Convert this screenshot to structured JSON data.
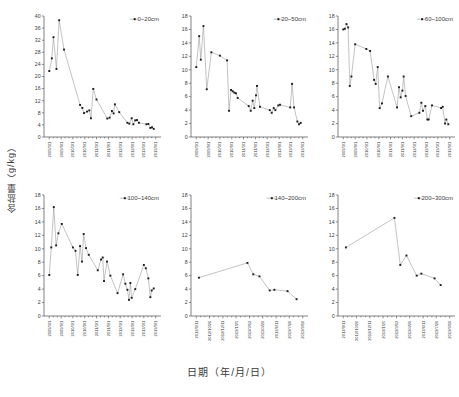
{
  "figure": {
    "ylabel": "含盐量（g/kg）",
    "xlabel": "日期（年/月/日）",
    "marker_color": "#1a1a1a",
    "line_color": "#9a9a9a"
  },
  "chart_data": [
    {
      "type": "scatter",
      "title": "",
      "legend": "0~20cm",
      "xlabel": "",
      "ylabel": "含盐量（g/kg）",
      "ylim": [
        0,
        40
      ],
      "yticks": [
        0,
        4,
        8,
        12,
        16,
        20,
        24,
        28,
        32,
        36,
        40
      ],
      "xticklabels": [
        "2009/3/1",
        "2009/9/1",
        "2010/3/1",
        "2010/9/1",
        "2011/3/1",
        "2011/9/1",
        "2012/3/1",
        "2012/9/1",
        "2013/3/1",
        "2013/9/1"
      ],
      "xlim_dates": [
        "2009/3/1",
        "2013/9/1"
      ],
      "grid": false,
      "legend_position": "top-right",
      "points": [
        {
          "x": "2009/03/01",
          "y": 21.8
        },
        {
          "x": "2009/04/10",
          "y": 26.0
        },
        {
          "x": "2009/05/05",
          "y": 33.0
        },
        {
          "x": "2009/06/20",
          "y": 22.5
        },
        {
          "x": "2009/08/01",
          "y": 38.6
        },
        {
          "x": "2009/10/15",
          "y": 28.9
        },
        {
          "x": "2010/06/20",
          "y": 10.6
        },
        {
          "x": "2010/07/25",
          "y": 9.6
        },
        {
          "x": "2010/08/20",
          "y": 7.9
        },
        {
          "x": "2010/10/05",
          "y": 8.4
        },
        {
          "x": "2010/11/10",
          "y": 8.8
        },
        {
          "x": "2010/12/05",
          "y": 6.2
        },
        {
          "x": "2011/01/10",
          "y": 15.9
        },
        {
          "x": "2011/03/01",
          "y": 12.4
        },
        {
          "x": "2011/08/15",
          "y": 6.1
        },
        {
          "x": "2011/09/20",
          "y": 6.4
        },
        {
          "x": "2011/10/25",
          "y": 8.6
        },
        {
          "x": "2011/11/20",
          "y": 7.8
        },
        {
          "x": "2011/12/10",
          "y": 10.8
        },
        {
          "x": "2012/02/15",
          "y": 8.2
        },
        {
          "x": "2012/06/20",
          "y": 4.7
        },
        {
          "x": "2012/07/20",
          "y": 4.4
        },
        {
          "x": "2012/08/25",
          "y": 6.2
        },
        {
          "x": "2012/09/20",
          "y": 4.2
        },
        {
          "x": "2012/10/20",
          "y": 5.5
        },
        {
          "x": "2012/11/15",
          "y": 5.6
        },
        {
          "x": "2012/12/15",
          "y": 4.7
        },
        {
          "x": "2013/04/10",
          "y": 4.2
        },
        {
          "x": "2013/05/10",
          "y": 4.3
        },
        {
          "x": "2013/06/10",
          "y": 3.0
        },
        {
          "x": "2013/07/05",
          "y": 3.2
        },
        {
          "x": "2013/08/01",
          "y": 2.7
        }
      ]
    },
    {
      "type": "scatter",
      "title": "",
      "legend": "20~50cm",
      "xlabel": "",
      "ylabel": "",
      "ylim": [
        0,
        18
      ],
      "yticks": [
        0,
        2,
        4,
        6,
        8,
        10,
        12,
        14,
        16,
        18
      ],
      "xticklabels": [
        "2009/3/1",
        "2009/9/1",
        "2010/3/1",
        "2010/9/1",
        "2011/3/1",
        "2011/9/1",
        "2012/3/1",
        "2012/9/1",
        "2013/3/1",
        "2013/9/1"
      ],
      "xlim_dates": [
        "2009/3/1",
        "2013/9/1"
      ],
      "grid": false,
      "legend_position": "top-right",
      "points": [
        {
          "x": "2009/03/01",
          "y": 10.4
        },
        {
          "x": "2009/04/15",
          "y": 15.0
        },
        {
          "x": "2009/05/10",
          "y": 11.5
        },
        {
          "x": "2009/06/20",
          "y": 16.5
        },
        {
          "x": "2009/08/10",
          "y": 7.1
        },
        {
          "x": "2009/10/20",
          "y": 12.6
        },
        {
          "x": "2010/03/01",
          "y": 12.1
        },
        {
          "x": "2010/06/20",
          "y": 11.4
        },
        {
          "x": "2010/07/20",
          "y": 3.9
        },
        {
          "x": "2010/08/20",
          "y": 7.0
        },
        {
          "x": "2010/09/15",
          "y": 6.8
        },
        {
          "x": "2010/10/10",
          "y": 6.6
        },
        {
          "x": "2010/11/05",
          "y": 6.5
        },
        {
          "x": "2010/12/01",
          "y": 5.8
        },
        {
          "x": "2011/05/20",
          "y": 4.6
        },
        {
          "x": "2011/06/20",
          "y": 3.9
        },
        {
          "x": "2011/07/20",
          "y": 5.4
        },
        {
          "x": "2011/08/15",
          "y": 4.3
        },
        {
          "x": "2011/09/10",
          "y": 6.2
        },
        {
          "x": "2011/09/25",
          "y": 7.6
        },
        {
          "x": "2011/11/10",
          "y": 4.5
        },
        {
          "x": "2012/04/10",
          "y": 4.0
        },
        {
          "x": "2012/05/10",
          "y": 3.6
        },
        {
          "x": "2012/06/10",
          "y": 4.3
        },
        {
          "x": "2012/07/05",
          "y": 4.0
        },
        {
          "x": "2012/08/20",
          "y": 4.7
        },
        {
          "x": "2012/09/15",
          "y": 4.8
        },
        {
          "x": "2013/02/20",
          "y": 4.4
        },
        {
          "x": "2013/03/20",
          "y": 7.9
        },
        {
          "x": "2013/04/20",
          "y": 4.4
        },
        {
          "x": "2013/06/10",
          "y": 2.3
        },
        {
          "x": "2013/07/05",
          "y": 1.9
        },
        {
          "x": "2013/08/01",
          "y": 2.1
        }
      ]
    },
    {
      "type": "scatter",
      "title": "",
      "legend": "60~100cm",
      "xlabel": "",
      "ylabel": "",
      "ylim": [
        0,
        18
      ],
      "yticks": [
        0,
        2,
        4,
        6,
        8,
        10,
        12,
        14,
        16,
        18
      ],
      "xticklabels": [
        "2009/3/1",
        "2009/9/1",
        "2010/3/1",
        "2010/9/1",
        "2011/3/1",
        "2011/9/1",
        "2012/3/1",
        "2012/9/1",
        "2013/3/1",
        "2013/9/1"
      ],
      "xlim_dates": [
        "2009/3/1",
        "2013/9/1"
      ],
      "grid": false,
      "legend_position": "top-right",
      "points": [
        {
          "x": "2009/03/01",
          "y": 16.0
        },
        {
          "x": "2009/03/25",
          "y": 16.1
        },
        {
          "x": "2009/04/20",
          "y": 16.8
        },
        {
          "x": "2009/05/15",
          "y": 16.3
        },
        {
          "x": "2009/06/10",
          "y": 7.6
        },
        {
          "x": "2009/07/05",
          "y": 9.0
        },
        {
          "x": "2009/09/01",
          "y": 13.8
        },
        {
          "x": "2010/02/20",
          "y": 13.1
        },
        {
          "x": "2010/04/20",
          "y": 12.8
        },
        {
          "x": "2010/06/20",
          "y": 8.5
        },
        {
          "x": "2010/07/15",
          "y": 7.9
        },
        {
          "x": "2010/08/15",
          "y": 10.4
        },
        {
          "x": "2010/09/15",
          "y": 4.3
        },
        {
          "x": "2010/10/20",
          "y": 5.0
        },
        {
          "x": "2011/01/20",
          "y": 9.0
        },
        {
          "x": "2011/06/10",
          "y": 4.4
        },
        {
          "x": "2011/07/10",
          "y": 7.4
        },
        {
          "x": "2011/08/05",
          "y": 5.9
        },
        {
          "x": "2011/09/01",
          "y": 6.9
        },
        {
          "x": "2011/09/20",
          "y": 9.0
        },
        {
          "x": "2011/10/20",
          "y": 6.1
        },
        {
          "x": "2012/01/15",
          "y": 3.1
        },
        {
          "x": "2012/05/20",
          "y": 3.6
        },
        {
          "x": "2012/06/20",
          "y": 5.1
        },
        {
          "x": "2012/07/15",
          "y": 3.9
        },
        {
          "x": "2012/08/20",
          "y": 4.6
        },
        {
          "x": "2012/09/20",
          "y": 2.6
        },
        {
          "x": "2012/10/10",
          "y": 2.6
        },
        {
          "x": "2012/12/01",
          "y": 4.7
        },
        {
          "x": "2013/04/20",
          "y": 4.3
        },
        {
          "x": "2013/05/15",
          "y": 4.5
        },
        {
          "x": "2013/06/20",
          "y": 2.0
        },
        {
          "x": "2013/07/10",
          "y": 2.6
        },
        {
          "x": "2013/08/10",
          "y": 1.9
        }
      ]
    },
    {
      "type": "scatter",
      "title": "",
      "legend": "100~140cm",
      "xlabel": "",
      "ylabel": "",
      "ylim": [
        0,
        18
      ],
      "yticks": [
        0,
        2,
        4,
        6,
        8,
        10,
        12,
        14,
        16,
        18
      ],
      "xticklabels": [
        "2009/3/1",
        "2009/9/1",
        "2010/3/1",
        "2010/9/1",
        "2011/3/1",
        "2011/9/1",
        "2012/3/1",
        "2012/9/1",
        "2013/3/1",
        "2013/9/1"
      ],
      "xlim_dates": [
        "2009/3/1",
        "2013/9/1"
      ],
      "grid": false,
      "legend_position": "top-right",
      "points": [
        {
          "x": "2009/03/01",
          "y": 6.1
        },
        {
          "x": "2009/04/01",
          "y": 10.2
        },
        {
          "x": "2009/05/10",
          "y": 16.2
        },
        {
          "x": "2009/06/15",
          "y": 10.5
        },
        {
          "x": "2009/07/20",
          "y": 12.3
        },
        {
          "x": "2009/09/10",
          "y": 13.7
        },
        {
          "x": "2010/03/01",
          "y": 10.2
        },
        {
          "x": "2010/04/10",
          "y": 9.7
        },
        {
          "x": "2010/05/15",
          "y": 6.1
        },
        {
          "x": "2010/06/20",
          "y": 10.4
        },
        {
          "x": "2010/07/20",
          "y": 8.1
        },
        {
          "x": "2010/08/15",
          "y": 12.2
        },
        {
          "x": "2010/09/20",
          "y": 10.1
        },
        {
          "x": "2010/11/01",
          "y": 9.1
        },
        {
          "x": "2011/03/20",
          "y": 6.8
        },
        {
          "x": "2011/05/10",
          "y": 8.4
        },
        {
          "x": "2011/06/05",
          "y": 8.7
        },
        {
          "x": "2011/06/25",
          "y": 5.2
        },
        {
          "x": "2011/08/10",
          "y": 8.1
        },
        {
          "x": "2011/10/01",
          "y": 6.0
        },
        {
          "x": "2012/01/20",
          "y": 3.4
        },
        {
          "x": "2012/04/15",
          "y": 6.2
        },
        {
          "x": "2012/05/20",
          "y": 4.8
        },
        {
          "x": "2012/06/20",
          "y": 3.9
        },
        {
          "x": "2012/07/15",
          "y": 2.4
        },
        {
          "x": "2012/08/05",
          "y": 4.9
        },
        {
          "x": "2012/08/25",
          "y": 2.7
        },
        {
          "x": "2012/10/20",
          "y": 4.0
        },
        {
          "x": "2013/03/01",
          "y": 7.6
        },
        {
          "x": "2013/04/01",
          "y": 7.1
        },
        {
          "x": "2013/05/10",
          "y": 5.6
        },
        {
          "x": "2013/06/10",
          "y": 2.8
        },
        {
          "x": "2013/07/01",
          "y": 3.8
        },
        {
          "x": "2013/08/01",
          "y": 4.1
        }
      ]
    },
    {
      "type": "scatter",
      "title": "",
      "legend": "140~200cm",
      "xlabel": "",
      "ylabel": "",
      "ylim": [
        0,
        18
      ],
      "yticks": [
        0,
        2,
        4,
        6,
        8,
        10,
        12,
        14,
        16,
        18
      ],
      "xticklabels": [
        "2012/9/11",
        "2012/10/26",
        "2012/12/11",
        "2013/1/25",
        "2013/3/12",
        "2013/4/26",
        "2013/6/11",
        "2013/7/26",
        "2013/9/10"
      ],
      "xlim_dates": [
        "2012/9/11",
        "2013/9/10"
      ],
      "grid": false,
      "legend_position": "top-right",
      "points": [
        {
          "x": "2012/09/20",
          "y": 5.7
        },
        {
          "x": "2013/03/05",
          "y": 7.9
        },
        {
          "x": "2013/03/25",
          "y": 6.2
        },
        {
          "x": "2013/04/15",
          "y": 5.9
        },
        {
          "x": "2013/05/20",
          "y": 3.8
        },
        {
          "x": "2013/06/05",
          "y": 3.9
        },
        {
          "x": "2013/07/20",
          "y": 3.7
        },
        {
          "x": "2013/08/20",
          "y": 2.5
        }
      ]
    },
    {
      "type": "scatter",
      "title": "",
      "legend": "200~300cm",
      "xlabel": "",
      "ylabel": "",
      "ylim": [
        0,
        18
      ],
      "yticks": [
        0,
        2,
        4,
        6,
        8,
        10,
        12,
        14,
        16,
        18
      ],
      "xticklabels": [
        "2012/9/11",
        "2012/10/26",
        "2012/12/11",
        "2013/1/25",
        "2013/3/12",
        "2013/4/26",
        "2013/6/11",
        "2013/7/26",
        "2013/9/10"
      ],
      "xlim_dates": [
        "2012/9/11",
        "2013/9/10"
      ],
      "grid": false,
      "legend_position": "top-right",
      "points": [
        {
          "x": "2012/09/20",
          "y": 10.2
        },
        {
          "x": "2013/03/05",
          "y": 14.6
        },
        {
          "x": "2013/03/25",
          "y": 7.6
        },
        {
          "x": "2013/04/15",
          "y": 9.0
        },
        {
          "x": "2013/05/20",
          "y": 6.0
        },
        {
          "x": "2013/06/05",
          "y": 6.3
        },
        {
          "x": "2013/07/20",
          "y": 5.6
        },
        {
          "x": "2013/08/10",
          "y": 4.6
        }
      ]
    }
  ]
}
